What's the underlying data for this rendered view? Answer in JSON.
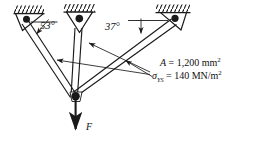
{
  "figure": {
    "ink_color": "#1a1a1a",
    "background": "#ffffff"
  },
  "annotations": {
    "angle_left": {
      "value": "53",
      "degree_symbol": "°",
      "text": "53°"
    },
    "angle_right": {
      "value": "37",
      "degree_symbol": "°",
      "text": "37°"
    },
    "force_label": "F"
  },
  "properties": {
    "area": {
      "symbol": "A",
      "equals": "=",
      "value": "1,200",
      "unit": "mm",
      "exponent": "2",
      "text": "A = 1,200 mm2"
    },
    "yield_stress": {
      "symbol": "σ",
      "subscript": "YS",
      "equals": "=",
      "value": "140",
      "unit": "MN/m",
      "exponent": "2",
      "text": "σYS = 140 MN/m2"
    }
  },
  "geometry": {
    "joints": {
      "support_left": {
        "x": 27,
        "y": 19,
        "label": "left pinned support"
      },
      "support_mid": {
        "x": 79,
        "y": 19,
        "label": "middle pinned support"
      },
      "support_mid_lower": {
        "x": 79,
        "y": 32,
        "label": "middle bracket base"
      },
      "support_right": {
        "x": 175,
        "y": 18,
        "label": "right pinned support"
      },
      "bottom": {
        "x": 74,
        "y": 96,
        "label": "common bottom joint"
      }
    },
    "members": [
      {
        "name": "member-left",
        "from": "support_left",
        "to": "bottom"
      },
      {
        "name": "member-middle",
        "from": "support_mid_lower",
        "to": "bottom"
      },
      {
        "name": "member-right",
        "from": "support_right",
        "to": "bottom"
      }
    ],
    "load": {
      "name": "applied-force",
      "from_y": 96,
      "to_y": 131,
      "direction": "down"
    }
  },
  "leaders": [
    {
      "name": "leader-to-left-member",
      "label": "arrow pointing to left member"
    },
    {
      "name": "leader-to-middle-member",
      "label": "arrow pointing to middle member"
    },
    {
      "name": "leader-to-right-member",
      "label": "arrow pointing to right member"
    }
  ]
}
